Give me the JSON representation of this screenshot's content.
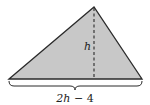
{
  "diagram": {
    "shape": "triangle",
    "fill_color": "#c8c8c8",
    "stroke_color": "#2a2a2a",
    "vertices": {
      "left": [
        9,
        79
      ],
      "apex": [
        94,
        7
      ],
      "right": [
        142,
        79
      ]
    },
    "height_label": "h",
    "base_label_var": "2h",
    "base_label_rest": " − 4"
  }
}
